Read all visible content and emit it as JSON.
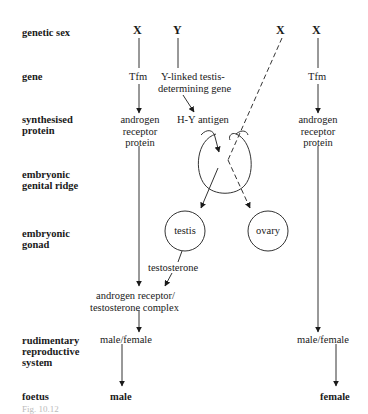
{
  "row_labels": {
    "genetic_sex": "genetic sex",
    "gene": "gene",
    "synthesised_protein_1": "synthesised",
    "synthesised_protein_2": "protein",
    "genital_ridge_1": "embryonic",
    "genital_ridge_2": "genital ridge",
    "gonad_1": "embryonic",
    "gonad_2": "gonad",
    "rudimentary_1": "rudimentary",
    "rudimentary_2": "reproductive",
    "rudimentary_3": "system",
    "foetus": "foetus"
  },
  "male_pathway": {
    "x_chromosome": "X",
    "y_chromosome": "Y",
    "tfm_gene": "Tfm",
    "y_gene_1": "Y-linked testis-",
    "y_gene_2": "determining gene",
    "protein_1": "androgen",
    "protein_2": "receptor",
    "protein_3": "protein",
    "hy_antigen": "H-Y antigen",
    "testis": "testis",
    "ovary": "ovary",
    "hormone": "testosterone",
    "complex_1": "androgen receptor/",
    "complex_2": "testosterone complex",
    "rudimentary": "male/female",
    "outcome": "male"
  },
  "female_pathway": {
    "x_dashed": "X",
    "x_chromosome": "X",
    "tfm_gene": "Tfm",
    "protein_1": "androgen",
    "protein_2": "receptor",
    "protein_3": "protein",
    "rudimentary": "male/female",
    "outcome": "female"
  },
  "caption": "Fig. 10.12"
}
